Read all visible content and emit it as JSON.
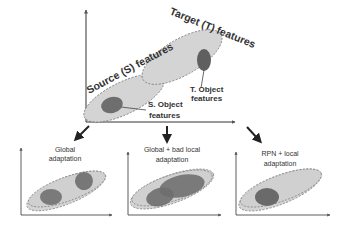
{
  "main_panel": {
    "target_label": "Target (T) features",
    "source_label": "Source (S) features",
    "t_object_line1": "T. Object",
    "t_object_line2": "features",
    "s_object_line1": "S. Object",
    "s_object_line2": "features"
  },
  "sub_panels": [
    {
      "title_line1": "Global",
      "title_line2": "adaptation"
    },
    {
      "title_line1": "Global + bad local",
      "title_line2": "adaptation"
    },
    {
      "title_line1": "RPN + local",
      "title_line2": "adaptation"
    }
  ],
  "colors": {
    "ellipse_fill": "#d4d4d4",
    "ellipse_stroke": "#777777",
    "object_fill": "#6e6e6e",
    "axis": "#333333"
  }
}
